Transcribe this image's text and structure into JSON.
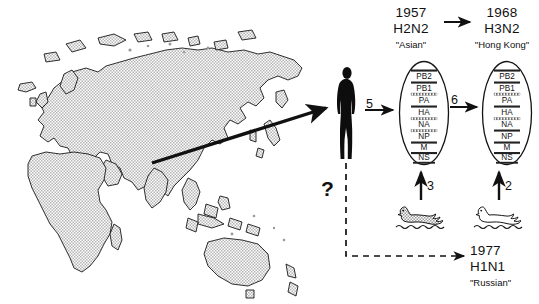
{
  "diagram": {
    "title_epochs": [
      {
        "id": "pandemic-1957",
        "year": "1957",
        "subtype": "H2N2",
        "nickname": "\"Asian\""
      },
      {
        "id": "pandemic-1968",
        "year": "1968",
        "subtype": "H3N2",
        "nickname": "\"Hong Kong\""
      },
      {
        "id": "pandemic-1977",
        "year": "1977",
        "subtype": "H1N1",
        "nickname": "\"Russian\""
      }
    ],
    "gene_segments": [
      "PB2",
      "PB1",
      "PA",
      "HA",
      "NA",
      "NP",
      "M",
      "NS"
    ],
    "virions": [
      {
        "id": "virion-h2n2",
        "label": "1957 H2N2 virion",
        "segments": [
          {
            "name": "PB2",
            "origin": "human"
          },
          {
            "name": "PB1",
            "origin": "avian"
          },
          {
            "name": "PA",
            "origin": "human"
          },
          {
            "name": "HA",
            "origin": "avian"
          },
          {
            "name": "NA",
            "origin": "avian"
          },
          {
            "name": "NP",
            "origin": "human"
          },
          {
            "name": "M",
            "origin": "human"
          },
          {
            "name": "NS",
            "origin": "human"
          }
        ]
      },
      {
        "id": "virion-h3n2",
        "label": "1968 H3N2 virion",
        "segments": [
          {
            "name": "PB2",
            "origin": "human"
          },
          {
            "name": "PB1",
            "origin": "avian"
          },
          {
            "name": "PA",
            "origin": "human"
          },
          {
            "name": "HA",
            "origin": "avian"
          },
          {
            "name": "NA",
            "origin": "human"
          },
          {
            "name": "NP",
            "origin": "human"
          },
          {
            "name": "M",
            "origin": "human"
          },
          {
            "name": "NS",
            "origin": "human"
          }
        ]
      }
    ],
    "arrow_labels": {
      "human_to_h2n2": "5",
      "h2n2_to_h3n2": "6",
      "duck_to_h2n2": "3",
      "duck_to_h3n2": "2"
    },
    "unknown_marker": "?",
    "map": {
      "name": "eurasia-africa-australia-map",
      "origin_arrow_label": ""
    },
    "figures": {
      "human": "human-silhouette",
      "duck_left": "duck-waterfowl-shaded",
      "duck_right": "duck-waterfowl-outline"
    }
  },
  "colors": {
    "ink": "#111111",
    "map_fill": "#c9c9c9",
    "segment_avian": "#8d8d8d",
    "paper": "#ffffff"
  }
}
